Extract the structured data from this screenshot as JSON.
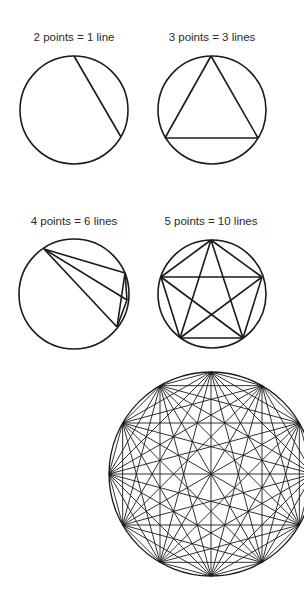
{
  "panels": [
    {
      "label": "2 points = 1 line",
      "points": 2,
      "lines": 1,
      "cx": 74,
      "cy": 110,
      "r": 54,
      "label_x": 74,
      "label_y": 31,
      "vertices": [
        [
          74,
          56
        ],
        [
          121,
          137
        ]
      ]
    },
    {
      "label": "3 points = 3 lines",
      "points": 3,
      "lines": 3,
      "cx": 212,
      "cy": 110,
      "r": 54,
      "label_x": 212,
      "label_y": 31,
      "vertices": [
        [
          211,
          56
        ],
        [
          165,
          138
        ],
        [
          258,
          138
        ]
      ]
    },
    {
      "label": "4 points = 6 lines",
      "points": 4,
      "lines": 6,
      "cx": 74,
      "cy": 294,
      "r": 55,
      "label_x": 74,
      "label_y": 215,
      "vertices": [
        [
          44,
          249
        ],
        [
          125,
          273
        ],
        [
          127,
          300
        ],
        [
          117,
          327
        ]
      ]
    },
    {
      "label": "5 points = 10 lines",
      "points": 5,
      "lines": 10,
      "cx": 212,
      "cy": 294,
      "r": 54,
      "label_x": 211,
      "label_y": 215,
      "vertices": [
        [
          211,
          240
        ],
        [
          161,
          277
        ],
        [
          262,
          277
        ],
        [
          180,
          338
        ],
        [
          243,
          338
        ]
      ]
    },
    {
      "label": "",
      "points": 12,
      "lines": 66,
      "cx": 211,
      "cy": 474,
      "r": 102,
      "regular": true
    }
  ],
  "style": {
    "stroke": "#1a1a1a",
    "text_color": "#2a2a2a"
  }
}
